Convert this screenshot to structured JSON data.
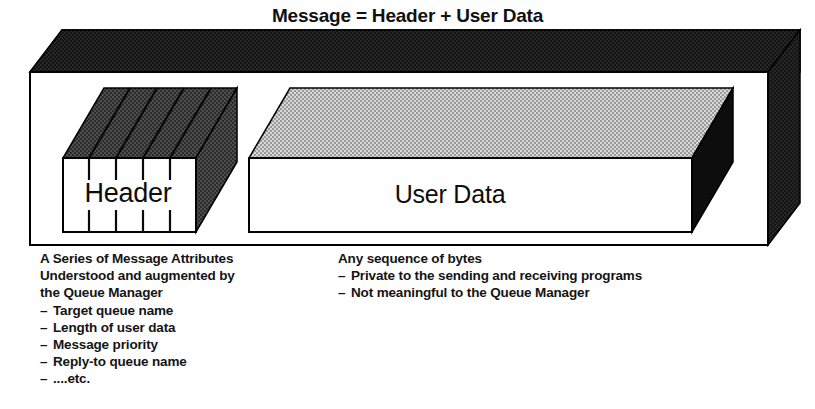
{
  "title": "Message = Header + User Data",
  "diagram": {
    "type": "block-diagram",
    "outer_block": {
      "name": "Message",
      "top_face_color": "#1a1a1a",
      "front_face_color": "#ffffff",
      "outline_color": "#000000"
    },
    "blocks": [
      {
        "id": "header",
        "label": "Header",
        "top_face_color": "#3d3d3d",
        "front_face_color": "#ffffff",
        "side_face_color": "#3d3d3d",
        "segments": 5,
        "note": "subdivided into message attribute fields"
      },
      {
        "id": "user-data",
        "label": "User Data",
        "top_face_color": "#b9b9b9",
        "front_face_color": "#ffffff",
        "side_face_color": "#0d0d0d",
        "segments": 1
      }
    ]
  },
  "captions": {
    "header": {
      "lead": [
        "A Series of Message Attributes",
        "Understood and augmented by",
        "the Queue Manager"
      ],
      "dash": "–",
      "items": [
        "Target queue name",
        "Length of user data",
        "Message priority",
        "Reply-to queue name",
        "....etc."
      ]
    },
    "user_data": {
      "lead": [
        "Any sequence of bytes"
      ],
      "dash": "–",
      "items": [
        "Private to the sending and receiving programs",
        "Not meaningful to the Queue Manager"
      ]
    }
  },
  "labels": {
    "header_block": "Header",
    "user_data_block": "User Data"
  }
}
